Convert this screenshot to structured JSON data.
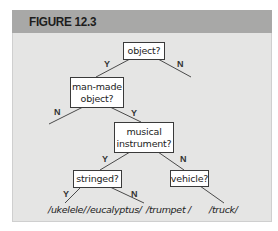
{
  "figure": {
    "title": "FIGURE 12.3",
    "colors": {
      "header_bg": "#a8a8a7",
      "content_bg": "#e5e5e4",
      "node_bg": "#ffffff",
      "line": "#444444"
    }
  },
  "tree": {
    "nodes": {
      "object": {
        "label": "object?"
      },
      "man_made": {
        "line1": "man-made",
        "line2": "object?"
      },
      "musical": {
        "line1": "musical",
        "line2": "instrument?"
      },
      "stringed": {
        "label": "stringed?"
      },
      "vehicle": {
        "label": "vehicle?"
      }
    },
    "edge_labels": {
      "object_yes": "Y",
      "object_no": "N",
      "man_made_no": "N",
      "man_made_yes": "Y",
      "musical_yes": "Y",
      "musical_no": "N",
      "stringed_yes": "Y",
      "stringed_no": "N"
    },
    "leaves": [
      "/ukelele/",
      "/eucalyptus/",
      "/trumpet /",
      "/truck/"
    ]
  }
}
